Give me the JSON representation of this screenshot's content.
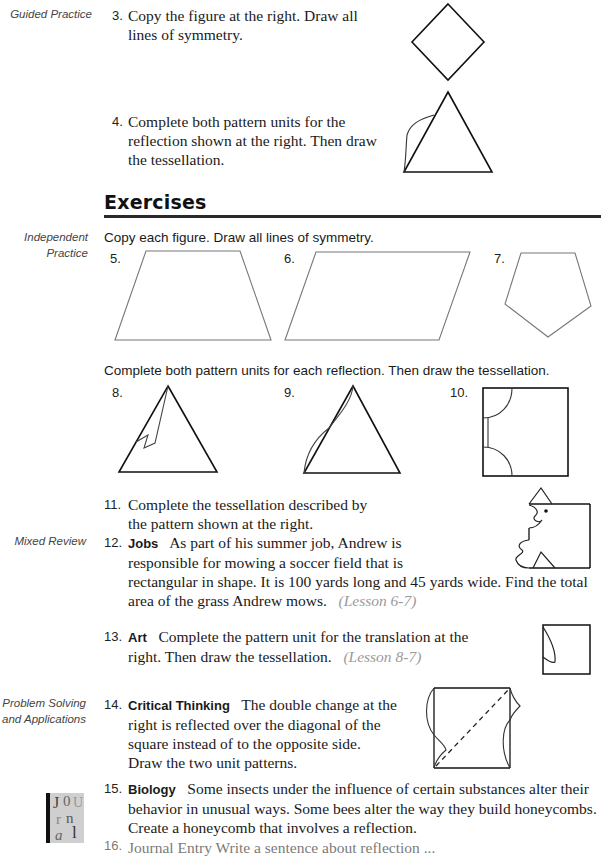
{
  "margin_labels": {
    "guided_practice": "Guided Practice",
    "independent_practice_1": "Independent",
    "independent_practice_2": "Practice",
    "mixed_review": "Mixed Review",
    "problem_solving_1": "Problem Solving",
    "problem_solving_2": "and Applications"
  },
  "guided": {
    "ex3": {
      "number": "3.",
      "line1": "Copy the figure at the right. Draw all",
      "line2": "lines of symmetry."
    },
    "ex4": {
      "number": "4.",
      "line1": "Complete both pattern units for the",
      "line2": "reflection shown at the right. Then draw",
      "line3": "the tessellation."
    }
  },
  "section": {
    "title": "Exercises"
  },
  "independent": {
    "instruction1": "Copy each figure. Draw all lines of symmetry.",
    "figures1": [
      {
        "number": "5.",
        "shape": "trapezoid"
      },
      {
        "number": "6.",
        "shape": "parallelogram"
      },
      {
        "number": "7.",
        "shape": "pentagon"
      }
    ],
    "instruction2": "Complete both pattern units for each reflection. Then draw the tessellation.",
    "figures2": [
      {
        "number": "8.",
        "shape": "triangle-zigzag"
      },
      {
        "number": "9.",
        "shape": "triangle-curve"
      },
      {
        "number": "10.",
        "shape": "square-arcs"
      }
    ],
    "ex11": {
      "number": "11.",
      "line1": "Complete the tessellation described by",
      "line2": "the pattern shown at the right."
    }
  },
  "mixed_review": {
    "ex12": {
      "number": "12.",
      "keyword": "Jobs",
      "line1": "As part of his summer job, Andrew is",
      "line2": "responsible for mowing a soccer field that is",
      "line3": "rectangular in shape. It is 100 yards long and 45 yards wide. Find the total",
      "line4": "area of the grass Andrew mows.",
      "lesson": "(Lesson 6-7)"
    },
    "ex13": {
      "number": "13.",
      "keyword": "Art",
      "line1": "Complete the pattern unit for the translation at the",
      "line2": "right. Then draw the tessellation.",
      "lesson": "(Lesson 8-7)"
    }
  },
  "problem_solving": {
    "ex14": {
      "number": "14.",
      "keyword": "Critical Thinking",
      "line1": "The double change at the",
      "line2": "right is reflected over the diagonal of the",
      "line3": "square instead of to the opposite side.",
      "line4": "Draw the two unit patterns."
    },
    "ex15": {
      "number": "15.",
      "keyword": "Biology",
      "line1": "Some insects under the influence of certain substances alter their",
      "line2": "behavior in unusual ways. Some bees alter the way they build honeycombs.",
      "line3": "Create a honeycomb that involves a reflection."
    },
    "ex16_partial": {
      "number": "16.",
      "text": "Journal Entry  Write a sentence about reflection ..."
    }
  },
  "journal_icon": {
    "letters": [
      "J",
      "0",
      "U",
      "r",
      "n",
      "a",
      "l"
    ]
  }
}
